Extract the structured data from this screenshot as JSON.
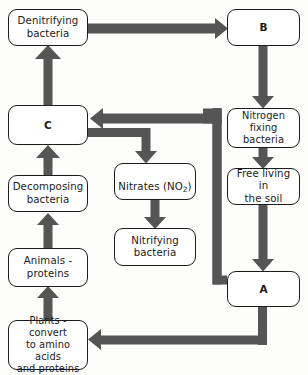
{
  "diagram": {
    "colors": {
      "arrow": "#555555",
      "box_border": "#1c1c1c",
      "box_fill": "#ffffff",
      "background": "#fdfdfc",
      "text": "#1a1a1a"
    },
    "nodes": [
      {
        "id": "denitrifying",
        "label": "Denitrifying\nbacteria",
        "x": 8,
        "y": 9,
        "w": 80,
        "h": 37,
        "style": "normal"
      },
      {
        "id": "b",
        "label": "B",
        "x": 227,
        "y": 9,
        "w": 73,
        "h": 37,
        "style": "letter"
      },
      {
        "id": "c",
        "label": "C",
        "x": 8,
        "y": 105,
        "w": 80,
        "h": 40,
        "style": "letter"
      },
      {
        "id": "nitrogen_fix",
        "label": "Nitrogen fixing\nbacteria",
        "x": 227,
        "y": 108,
        "w": 73,
        "h": 40,
        "style": "small-text"
      },
      {
        "id": "nitrates",
        "label": "Nitrates (NO2)",
        "x": 114,
        "y": 163,
        "w": 82,
        "h": 37,
        "style": "normal",
        "has_subscript": true
      },
      {
        "id": "free_living",
        "label": "Free living in\nthe soil",
        "x": 227,
        "y": 168,
        "w": 73,
        "h": 37,
        "style": "normal"
      },
      {
        "id": "decomposing",
        "label": "Decomposing\nbacteria",
        "x": 8,
        "y": 175,
        "w": 80,
        "h": 37,
        "style": "normal"
      },
      {
        "id": "nitrifying",
        "label": "Nitrifying\nbacteria",
        "x": 114,
        "y": 228,
        "w": 82,
        "h": 38,
        "style": "normal"
      },
      {
        "id": "animals",
        "label": "Animals -\nproteins",
        "x": 8,
        "y": 248,
        "w": 80,
        "h": 39,
        "style": "normal"
      },
      {
        "id": "a",
        "label": "A",
        "x": 227,
        "y": 271,
        "w": 73,
        "h": 36,
        "style": "letter"
      },
      {
        "id": "plants",
        "label": "Plants - convert\nto amino acids\nand proteins",
        "x": 8,
        "y": 320,
        "w": 80,
        "h": 50,
        "style": "small-text"
      }
    ],
    "edges": [
      {
        "id": "denitrifying-to-b",
        "from": "denitrifying",
        "to": "b",
        "direction": "right"
      },
      {
        "id": "b-to-nitrogen-fixing",
        "from": "b",
        "to": "nitrogen_fix",
        "direction": "down"
      },
      {
        "id": "nitrogen-fixing-to-free",
        "from": "nitrogen_fix",
        "to": "free_living",
        "direction": "down"
      },
      {
        "id": "free-living-to-a",
        "from": "free_living",
        "to": "a",
        "direction": "down"
      },
      {
        "id": "a-to-c",
        "from": "a",
        "to": "c",
        "direction": "left-up-left"
      },
      {
        "id": "a-to-plants",
        "from": "a",
        "to": "plants",
        "direction": "down-left"
      },
      {
        "id": "plants-to-animals",
        "from": "plants",
        "to": "animals",
        "direction": "up"
      },
      {
        "id": "animals-to-decomposing",
        "from": "animals",
        "to": "decomposing",
        "direction": "up"
      },
      {
        "id": "decomposing-to-c",
        "from": "decomposing",
        "to": "c",
        "direction": "up"
      },
      {
        "id": "c-to-denitrifying",
        "from": "c",
        "to": "denitrifying",
        "direction": "up"
      },
      {
        "id": "c-to-nitrates",
        "from": "c",
        "to": "nitrates",
        "direction": "right-down"
      },
      {
        "id": "nitrates-to-nitrifying",
        "from": "nitrates",
        "to": "nitrifying",
        "direction": "down"
      }
    ]
  }
}
